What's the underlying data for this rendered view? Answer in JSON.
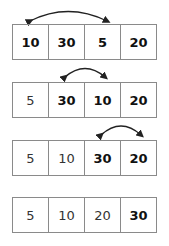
{
  "steps": [
    {
      "cells": [
        {
          "value": "10",
          "bold": true
        },
        {
          "value": "30",
          "bold": true
        },
        {
          "value": "5",
          "bold": true
        },
        {
          "value": "20",
          "bold": true
        }
      ],
      "swap": [
        0,
        2
      ]
    },
    {
      "cells": [
        {
          "value": "5",
          "bold": false
        },
        {
          "value": "30",
          "bold": true
        },
        {
          "value": "10",
          "bold": true
        },
        {
          "value": "20",
          "bold": true
        }
      ],
      "swap": [
        1,
        2
      ]
    },
    {
      "cells": [
        {
          "value": "5",
          "bold": false
        },
        {
          "value": "10",
          "bold": false
        },
        {
          "value": "30",
          "bold": true
        },
        {
          "value": "20",
          "bold": true
        }
      ],
      "swap": [
        2,
        3
      ]
    },
    {
      "cells": [
        {
          "value": "5",
          "bold": false
        },
        {
          "value": "10",
          "bold": false
        },
        {
          "value": "20",
          "bold": false
        },
        {
          "value": "30",
          "bold": true
        }
      ],
      "swap": null
    }
  ],
  "colors": {
    "border": "#8a8a8a",
    "arrow": "#222222",
    "text": "#222222"
  }
}
